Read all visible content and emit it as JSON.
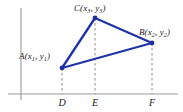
{
  "figure": {
    "background_color": "#ffffff",
    "axis_color": "#9a9a9a",
    "dash_color": "#8c8c8c",
    "triangle_color": "#2233a8",
    "vertex_dot_color": "#1f2f9e",
    "label_color": "#1a1a1a"
  },
  "axes": {
    "y_axis": {
      "x": 21,
      "y_top": 8,
      "y_bottom": 100
    },
    "x_axis": {
      "y": 94,
      "x_left": 8,
      "x_right": 178
    }
  },
  "chart_data": {
    "type": "scatter",
    "title": "",
    "xlabel": "",
    "ylabel": "",
    "grid": false,
    "legend": null,
    "points": [
      {
        "name": "A",
        "label": "A(x1, y1)",
        "px": 62,
        "py": 68,
        "foot": "D"
      },
      {
        "name": "B",
        "label": "B(x2, y2)",
        "px": 152,
        "py": 43,
        "foot": "F"
      },
      {
        "name": "C",
        "label": "C(x3, y3)",
        "px": 95,
        "py": 18,
        "foot": "E"
      }
    ],
    "feet": [
      {
        "name": "D",
        "px": 62,
        "py": 94
      },
      {
        "name": "E",
        "px": 95,
        "py": 94
      },
      {
        "name": "F",
        "px": 152,
        "py": 94
      }
    ],
    "edges": [
      {
        "from": "A",
        "to": "C"
      },
      {
        "from": "C",
        "to": "B"
      },
      {
        "from": "B",
        "to": "A"
      }
    ]
  },
  "labels": {
    "vertex_a": {
      "letter": "A",
      "open": "(",
      "var1": "x",
      "sub1": "1",
      "comma": ", ",
      "var2": "y",
      "sub2": "1",
      "close": ")"
    },
    "vertex_b": {
      "letter": "B",
      "open": "(",
      "var1": "x",
      "sub1": "2",
      "comma": ", ",
      "var2": "y",
      "sub2": "2",
      "close": ")"
    },
    "vertex_c": {
      "letter": "C",
      "open": "(",
      "var1": "x",
      "sub1": "3",
      "comma": ", ",
      "var2": "y",
      "sub2": "3",
      "close": ")"
    },
    "foot_d": "D",
    "foot_e": "E",
    "foot_f": "F"
  }
}
